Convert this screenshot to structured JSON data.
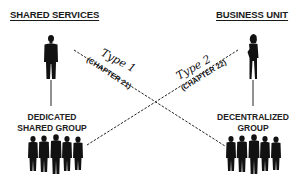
{
  "headers": {
    "left": "SHARED SERVICES",
    "right": "BUSINESS UNIT"
  },
  "groups": {
    "left": {
      "line1": "DEDICATED",
      "line2": "SHARED GROUP"
    },
    "right": {
      "line1": "DECENTRALIZED",
      "line2": "GROUP"
    }
  },
  "connectors": [
    {
      "type_label": "Type 1",
      "chapter_label": "(CHAPTER 21)",
      "from": "shared-services-leader",
      "to": "decentralized-group",
      "style": "dashed"
    },
    {
      "type_label": "Type 2",
      "chapter_label": "(CHAPTER 22)",
      "from": "dedicated-shared-group",
      "to": "business-unit-leader",
      "style": "dashed"
    }
  ],
  "figures": {
    "left_leader": "man-silhouette-icon",
    "right_leader": "woman-silhouette-icon",
    "left_group": "group-silhouette-icon",
    "right_group": "group-silhouette-icon"
  },
  "colors": {
    "ink": "#111111",
    "background": "#ffffff"
  }
}
